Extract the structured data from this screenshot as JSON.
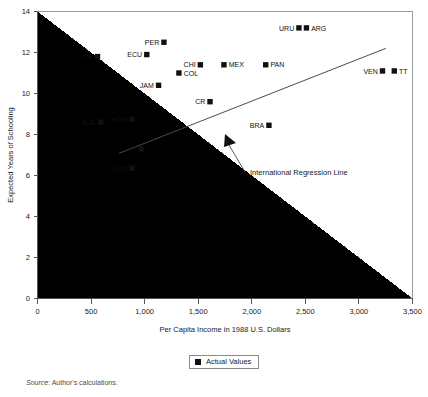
{
  "chart_data": {
    "type": "scatter",
    "title": "",
    "xlabel": "Per Capita Income in 1988 U.S. Dollars",
    "ylabel": "Expected Years of Schooling",
    "xlim": [
      0,
      3500
    ],
    "ylim": [
      0,
      14
    ],
    "xticks": [
      0,
      500,
      1000,
      1500,
      2000,
      2500,
      3000,
      3500
    ],
    "xtick_labels": [
      "0",
      "500",
      "1,000",
      "1,500",
      "2,000",
      "2,500",
      "3,000",
      "3,500"
    ],
    "yticks": [
      0,
      2,
      4,
      6,
      8,
      10,
      12,
      14
    ],
    "ytick_labels": [
      "0",
      "2",
      "4",
      "6",
      "8",
      "10",
      "12",
      "14"
    ],
    "grid": false,
    "legend": {
      "position": "bottom-center",
      "entries": [
        {
          "label": "Actual Values",
          "marker": "filled-square",
          "color": "#111111"
        }
      ]
    },
    "series": [
      {
        "name": "Actual Values",
        "marker": "filled-square",
        "color": "#111111",
        "points": [
          {
            "label": "DR",
            "x": 560,
            "y": 11.8,
            "label_side": "left"
          },
          {
            "label": "ECU",
            "x": 1020,
            "y": 11.9,
            "label_side": "left"
          },
          {
            "label": "PER",
            "x": 1180,
            "y": 12.5,
            "label_side": "left"
          },
          {
            "label": "COL",
            "x": 1320,
            "y": 11.0,
            "label_side": "right"
          },
          {
            "label": "CHI",
            "x": 1520,
            "y": 11.4,
            "label_side": "left"
          },
          {
            "label": "JAM",
            "x": 1130,
            "y": 10.4,
            "label_side": "left"
          },
          {
            "label": "MEX",
            "x": 1740,
            "y": 11.4,
            "label_side": "right"
          },
          {
            "label": "PAN",
            "x": 2130,
            "y": 11.4,
            "label_side": "right"
          },
          {
            "label": "URU",
            "x": 2440,
            "y": 13.2,
            "label_side": "left"
          },
          {
            "label": "ARG",
            "x": 2510,
            "y": 13.2,
            "label_side": "right"
          },
          {
            "label": "VEN",
            "x": 3220,
            "y": 11.1,
            "label_side": "left"
          },
          {
            "label": "TT",
            "x": 3330,
            "y": 11.1,
            "label_side": "right"
          },
          {
            "label": "CR",
            "x": 1610,
            "y": 9.6,
            "label_side": "left"
          },
          {
            "label": "BOL",
            "x": 590,
            "y": 8.6,
            "label_side": "left"
          },
          {
            "label": "HON",
            "x": 880,
            "y": 8.75,
            "label_side": "left"
          },
          {
            "label": "BRA",
            "x": 2160,
            "y": 8.45,
            "label_side": "left"
          },
          {
            "label": "ES",
            "x": 970,
            "y": 7.3,
            "label_side": "left"
          },
          {
            "label": "GUA",
            "x": 880,
            "y": 6.35,
            "label_side": "left"
          }
        ]
      }
    ],
    "regression_line": {
      "name": "International Regression Line",
      "x_start": 760,
      "y_start": 7.08,
      "x_end": 3250,
      "y_end": 12.2
    },
    "annotation": {
      "text": "International Regression Line",
      "arrow_target_x": 1890,
      "arrow_target_y": 8.2
    }
  },
  "source": {
    "prefix": "Source:",
    "text": "Author's calculations."
  }
}
